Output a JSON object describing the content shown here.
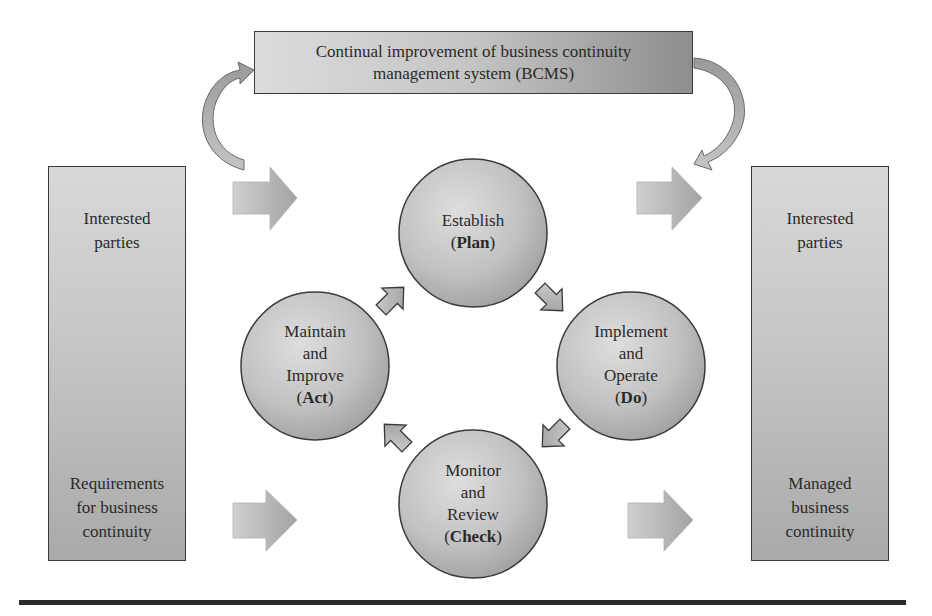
{
  "diagram": {
    "title_box": {
      "lines": [
        "Continual improvement of business continuity",
        "management system (BCMS)"
      ]
    },
    "left_box": {
      "top_lines": [
        "Interested",
        "parties"
      ],
      "bottom_lines": [
        "Requirements",
        "for business",
        "continuity"
      ]
    },
    "right_box": {
      "top_lines": [
        "Interested",
        "parties"
      ],
      "bottom_lines": [
        "Managed",
        "business",
        "continuity"
      ]
    },
    "cycle": [
      {
        "id": "plan",
        "lines": [
          "Establish"
        ],
        "phase": "Plan",
        "position": "top"
      },
      {
        "id": "do",
        "lines": [
          "Implement",
          "and",
          "Operate"
        ],
        "phase": "Do",
        "position": "right"
      },
      {
        "id": "check",
        "lines": [
          "Monitor",
          "and",
          "Review"
        ],
        "phase": "Check",
        "position": "bottom"
      },
      {
        "id": "act",
        "lines": [
          "Maintain",
          "and",
          "Improve"
        ],
        "phase": "Act",
        "position": "left"
      }
    ],
    "colors": {
      "fill_light": "#d9d9d9",
      "fill_dark": "#8e8e8e",
      "stroke": "#3a3a3a",
      "rule": "#2b2b2b"
    }
  }
}
